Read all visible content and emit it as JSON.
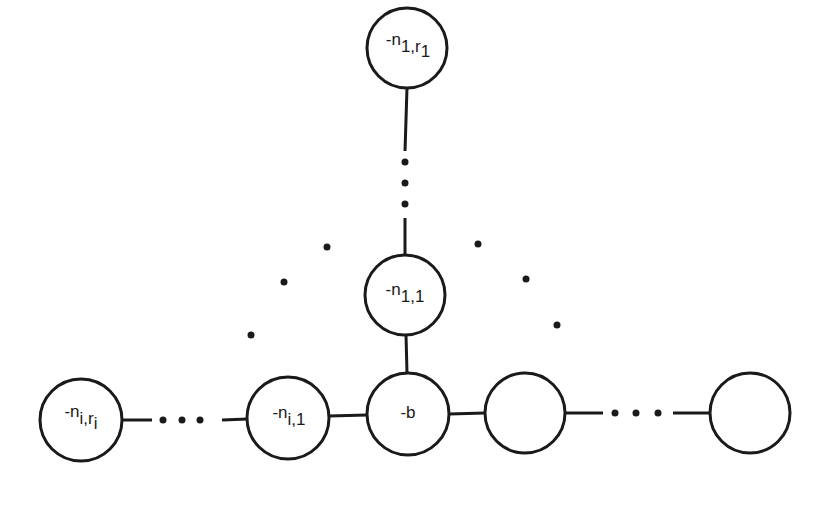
{
  "diagram": {
    "type": "plumbing graph (star-shaped tree)",
    "central_node": {
      "label": "-b"
    },
    "branches": [
      {
        "name": "branch-1-vertical",
        "nodes": [
          {
            "label_base": "-n",
            "label_sub": "1,1"
          },
          {
            "label_base": "-n",
            "label_sub": "1,r",
            "label_subsub": "1"
          }
        ]
      },
      {
        "name": "branch-i-left",
        "nodes": [
          {
            "label_base": "-n",
            "label_sub": "i,1"
          },
          {
            "label_base": "-n",
            "label_sub": "i,r",
            "label_subsub": "i"
          }
        ]
      },
      {
        "name": "branch-right",
        "nodes": [
          {
            "label": ""
          },
          {
            "label": ""
          }
        ]
      }
    ],
    "ellipsis": "…"
  },
  "labels": {
    "b": "-b",
    "n11_base": "-n",
    "n11_sub": "1,1",
    "n1r_base": "-n",
    "n1r_sub": "1,r",
    "n1r_subsub": "1",
    "ni1_base": "-n",
    "ni1_sub": "i,1",
    "nir_base": "-n",
    "nir_sub": "i,r",
    "nir_subsub": "i"
  },
  "colors": {
    "stroke": "#1a1a1a",
    "background": "#ffffff"
  }
}
